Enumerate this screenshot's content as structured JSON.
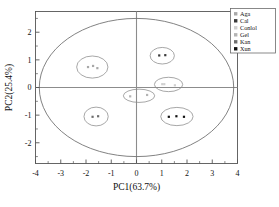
{
  "chart_data": {
    "type": "scatter",
    "title": "",
    "xlabel": "PC1(63.7%)",
    "ylabel": "PC2(25.4%)",
    "xlim": [
      -4,
      4
    ],
    "ylim": [
      -2.75,
      2.75
    ],
    "xticks": [
      -4,
      -3,
      -2,
      -1,
      0,
      1,
      2,
      3,
      4
    ],
    "xtick_labels": [
      "-4",
      "-3",
      "-2",
      "-1",
      "0",
      "1",
      "2",
      "3",
      "4"
    ],
    "yticks": [
      -2,
      -1,
      0,
      1,
      2
    ],
    "ytick_labels": [
      "-2",
      "-1",
      "0",
      "1",
      "2"
    ],
    "grid": false,
    "legend_position": "top-right",
    "confidence_ellipse": {
      "cx": 0.0,
      "cy": 0.0,
      "rx": 3.85,
      "ry": 2.5
    },
    "series": [
      {
        "name": "Aga",
        "color": "#a8a8a8",
        "marker": "square",
        "ellipse": {
          "cx": -1.75,
          "cy": 0.74,
          "rx": 0.62,
          "ry": 0.4
        },
        "points": [
          {
            "x": -1.92,
            "y": 0.74
          },
          {
            "x": -1.72,
            "y": 0.78
          },
          {
            "x": -1.55,
            "y": 0.7
          }
        ]
      },
      {
        "name": "Cal",
        "color": "#3a3a3a",
        "marker": "square",
        "ellipse": {
          "cx": 1.02,
          "cy": 1.15,
          "rx": 0.48,
          "ry": 0.3
        },
        "points": [
          {
            "x": 0.9,
            "y": 1.16
          },
          {
            "x": 1.14,
            "y": 1.17
          }
        ]
      },
      {
        "name": "Conlol",
        "color": "#d0d0d0",
        "marker": "square",
        "ellipse": {
          "cx": 1.27,
          "cy": 0.11,
          "rx": 0.56,
          "ry": 0.26
        },
        "points": [
          {
            "x": 1.02,
            "y": 0.12
          },
          {
            "x": 1.1,
            "y": 0.12
          },
          {
            "x": 1.52,
            "y": 0.08
          }
        ]
      },
      {
        "name": "Gel",
        "color": "#b4b4b4",
        "marker": "square",
        "ellipse": {
          "cx": 0.1,
          "cy": -0.3,
          "rx": 0.62,
          "ry": 0.24
        },
        "points": [
          {
            "x": -0.25,
            "y": -0.32
          },
          {
            "x": 0.42,
            "y": -0.27
          }
        ]
      },
      {
        "name": "Kan",
        "color": "#6e6e6e",
        "marker": "square",
        "ellipse": {
          "cx": -1.6,
          "cy": -1.05,
          "rx": 0.48,
          "ry": 0.34
        },
        "points": [
          {
            "x": -1.74,
            "y": -1.06
          },
          {
            "x": -1.52,
            "y": -1.04
          }
        ]
      },
      {
        "name": "Xun",
        "color": "#111111",
        "marker": "square",
        "ellipse": {
          "cx": 1.6,
          "cy": -1.05,
          "rx": 0.64,
          "ry": 0.33
        },
        "points": [
          {
            "x": 1.28,
            "y": -1.06
          },
          {
            "x": 1.58,
            "y": -1.04
          },
          {
            "x": 1.88,
            "y": -1.06
          }
        ]
      }
    ]
  },
  "legend": {
    "items": [
      {
        "label": "Aga",
        "color": "#a8a8a8"
      },
      {
        "label": "Cal",
        "color": "#3a3a3a"
      },
      {
        "label": "Conlol",
        "color": "#d0d0d0"
      },
      {
        "label": "Gel",
        "color": "#b4b4b4"
      },
      {
        "label": "Kan",
        "color": "#6e6e6e"
      },
      {
        "label": "Xun",
        "color": "#111111"
      }
    ]
  },
  "style": {
    "frame_color": "#555555",
    "axis_line_color": "#8c8c8c",
    "ellipse_color": "#6b6b6b",
    "cluster_ellipse_color": "#8a8a8a",
    "background": "#ffffff"
  }
}
